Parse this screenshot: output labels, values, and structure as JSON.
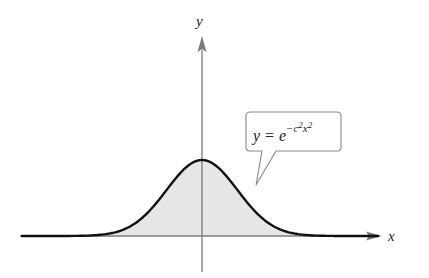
{
  "figure": {
    "type": "gaussian-curve-plot",
    "axes": {
      "x_label": "x",
      "y_label": "y",
      "color": "#7a7a7a"
    },
    "curve": {
      "equation_text": {
        "lhs": "y = e",
        "exp_prefix": "−c",
        "exp_c_power": "2",
        "exp_x": "x",
        "exp_x_power": "2"
      },
      "stroke_color": "#111111",
      "fill_color": "#e6e6e6"
    },
    "callout": {
      "border_color": "#888888",
      "background": "#ffffff"
    }
  },
  "chart_data": {
    "type": "area",
    "title": "",
    "xlabel": "x",
    "ylabel": "y",
    "function": "y = e^(-c^2 x^2)",
    "annotations": [
      "y = e^{-c^2 x^2}"
    ],
    "grid": false,
    "legend": null,
    "x": [
      -3,
      -2.5,
      -2,
      -1.5,
      -1,
      -0.5,
      0,
      0.5,
      1,
      1.5,
      2,
      2.5,
      3
    ],
    "series": [
      {
        "name": "y = e^{-c^2 x^2}",
        "values": [
          0.0001,
          0.0019,
          0.0183,
          0.1054,
          0.3679,
          0.7788,
          1.0,
          0.7788,
          0.3679,
          0.1054,
          0.0183,
          0.0019,
          0.0001
        ]
      }
    ],
    "shaded_region": "area under curve (above x-axis)"
  }
}
